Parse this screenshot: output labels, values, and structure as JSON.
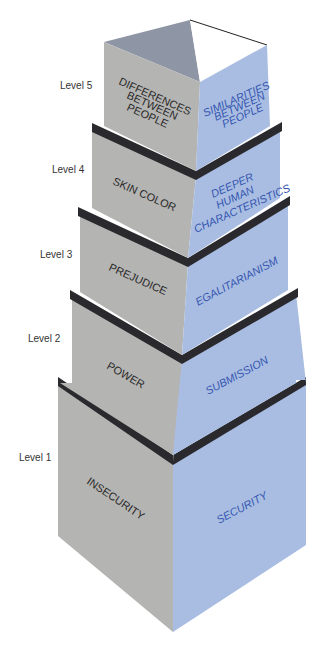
{
  "colors": {
    "left_face": "#b4b4b2",
    "right_face": "#a9bde2",
    "ledge": "#2a2a2e",
    "inner_left": "#8e96a6",
    "left_text": "#2a2a2a",
    "right_text": "#3556b0"
  },
  "levels": [
    {
      "label": "Level 5",
      "left_text": [
        "DIFFERENCES",
        "BETWEEN",
        "PEOPLE"
      ],
      "right_text": [
        "SIMILARITIES",
        "BETWEEN",
        "PEOPLE"
      ]
    },
    {
      "label": "Level 4",
      "left_text": [
        "SKIN COLOR"
      ],
      "right_text": [
        "DEEPER",
        "HUMAN",
        "CHARACTERISTICS"
      ]
    },
    {
      "label": "Level 3",
      "left_text": [
        "PREJUDICE"
      ],
      "right_text": [
        "EGALITARIANISM"
      ]
    },
    {
      "label": "Level 2",
      "left_text": [
        "POWER"
      ],
      "right_text": [
        "SUBMISSION"
      ]
    },
    {
      "label": "Level 1",
      "left_text": [
        "INSECURITY"
      ],
      "right_text": [
        "SECURITY"
      ]
    }
  ]
}
